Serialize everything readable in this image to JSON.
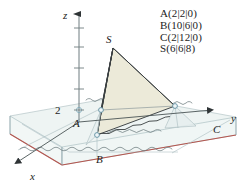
{
  "figure": {
    "axes": {
      "x_label": "x",
      "y_label": "y",
      "z_label": "z",
      "z_tick_label": "2",
      "z_tick_value": 2
    },
    "point_labels": {
      "A": "A",
      "B": "B",
      "C": "C",
      "S": "S"
    },
    "colors": {
      "pyramid_lit_face": "#eceadb",
      "pyramid_shadow_face": "#e4e2d2",
      "water_plane": "#e8f0ef",
      "slab_front_face": "#eef4f3",
      "slab_bottom_edge": "#b4554e",
      "axis_line": "#6f7d80",
      "outline": "#3a3f41",
      "grid_line": "#a9bcc0",
      "vertex_marker": "#7ba7b8",
      "text": "#1c1c1c",
      "background": "#ffffff"
    }
  },
  "coordinates": {
    "heading": "",
    "lines": [
      "A(2|2|0)",
      "B(10|6|0)",
      "C(2|12|0)",
      "S(6|6|8)"
    ],
    "points": [
      {
        "name": "A",
        "x": 2,
        "y": 2,
        "z": 0
      },
      {
        "name": "B",
        "x": 10,
        "y": 6,
        "z": 0
      },
      {
        "name": "C",
        "x": 2,
        "y": 12,
        "z": 0
      },
      {
        "name": "S",
        "x": 6,
        "y": 6,
        "z": 8
      }
    ]
  }
}
